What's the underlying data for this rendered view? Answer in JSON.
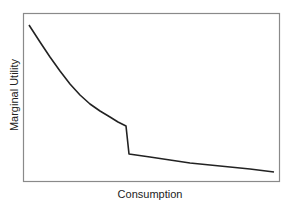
{
  "chart_data": {
    "type": "line",
    "title": "",
    "xlabel": "Consumption",
    "ylabel": "Marginal Utility",
    "grid": false,
    "legend": null,
    "axis_ticks": false,
    "annotations": [],
    "series": [
      {
        "name": "Marginal Utility",
        "color": "#222222",
        "points_px": [
          [
            29,
            25
          ],
          [
            40,
            42
          ],
          [
            50,
            57
          ],
          [
            60,
            71
          ],
          [
            70,
            84
          ],
          [
            80,
            95
          ],
          [
            90,
            104
          ],
          [
            100,
            111
          ],
          [
            110,
            117
          ],
          [
            118,
            122
          ],
          [
            126,
            126
          ],
          [
            129,
            154
          ],
          [
            150,
            157
          ],
          [
            170,
            160
          ],
          [
            190,
            163
          ],
          [
            210,
            165
          ],
          [
            230,
            167
          ],
          [
            250,
            169
          ],
          [
            274,
            172
          ]
        ],
        "description": "Convex decreasing curve with a sharp vertical drop (kink) at roughly 40% of consumption, then a flatter, slowly decreasing tail"
      }
    ],
    "xlim_px": [
      23,
      280
    ],
    "ylim_px": [
      13,
      182
    ]
  },
  "frame": {
    "color": "#8a8a8a"
  },
  "labels": {
    "x": "Consumption",
    "y": "Marginal Utility"
  }
}
